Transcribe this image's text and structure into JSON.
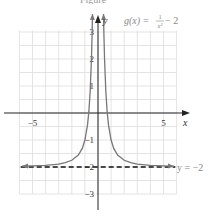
{
  "caption": "Figure",
  "chart_data": {
    "type": "line",
    "function_label": {
      "prefix": "g(x) = ",
      "num": "1",
      "den": "x²",
      "suffix": " − 2"
    },
    "xlabel": "x",
    "ylabel": "y",
    "xlim": [
      -6,
      6
    ],
    "ylim": [
      -3,
      3.5
    ],
    "x_ticks": [
      {
        "value": -5,
        "label": "−5"
      },
      {
        "value": 5,
        "label": "5"
      }
    ],
    "y_ticks": [
      {
        "value": 3,
        "label": "3"
      },
      {
        "value": 2,
        "label": "2"
      },
      {
        "value": 1,
        "label": "1"
      },
      {
        "value": -1,
        "label": "−1"
      },
      {
        "value": -2,
        "label": "−2"
      },
      {
        "value": -3,
        "label": "−3"
      }
    ],
    "grid": true,
    "series": [
      {
        "name": "g(x) = 1/x² − 2",
        "color": "#777777",
        "x": [
          -5.8,
          -5,
          -4,
          -3,
          -2.5,
          -2,
          -1.5,
          -1.2,
          -1,
          -0.8,
          -0.7,
          -0.6,
          -0.5,
          -0.45,
          -0.42
        ],
        "y": [
          -1.97,
          -1.96,
          -1.94,
          -1.89,
          -1.84,
          -1.75,
          -1.56,
          -1.31,
          -1.0,
          -0.44,
          0.04,
          0.78,
          2.0,
          2.94,
          3.67
        ]
      }
    ],
    "asymptote": {
      "label": "y = −2",
      "y": -2,
      "style": "dashed",
      "color": "#111111"
    },
    "colors": {
      "grid": "#dddddd",
      "axis": "#222222",
      "curve": "#777777",
      "text": "#333333",
      "label_gray": "#888888"
    }
  }
}
